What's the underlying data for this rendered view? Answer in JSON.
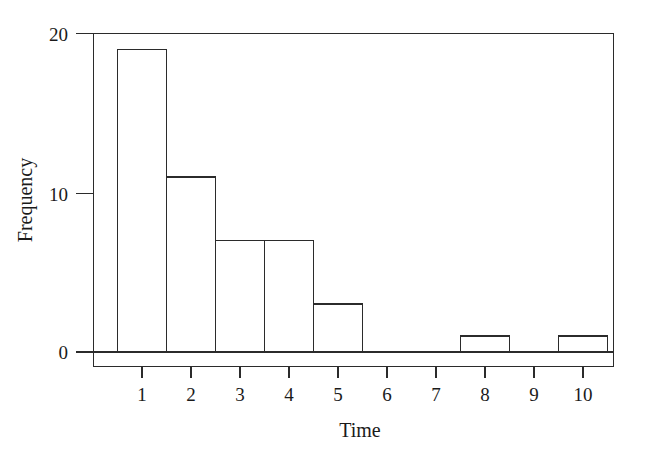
{
  "chart_data": {
    "type": "bar",
    "title": "",
    "subtitle": "",
    "xlabel": "Time",
    "ylabel": "Frequency",
    "categories": [
      "1",
      "2",
      "3",
      "4",
      "5",
      "6",
      "7",
      "8",
      "9",
      "10"
    ],
    "values": [
      19,
      11,
      7,
      7,
      3,
      0,
      0,
      1,
      0,
      1
    ],
    "series": [
      {
        "name": "Frequency",
        "values": [
          19,
          11,
          7,
          7,
          3,
          0,
          0,
          1,
          0,
          1
        ]
      }
    ],
    "x_tick_labels": [
      "1",
      "2",
      "3",
      "4",
      "5",
      "6",
      "7",
      "8",
      "9",
      "10"
    ],
    "y_tick_labels": [
      "0",
      "10",
      "20"
    ],
    "y_tick_values": [
      0,
      10,
      20
    ],
    "xlim": [
      0.5,
      10.5
    ],
    "ylim": [
      0,
      20
    ],
    "grid": false,
    "legend": false,
    "legend_position": "none",
    "bar_fill": "#ffffff",
    "bar_stroke": "#2b2b2b",
    "background": "#ffffff",
    "bin_width": 1,
    "annotations": []
  },
  "axes": {
    "y_title": "Frequency",
    "x_title": "Time"
  },
  "ticks": {
    "y": [
      {
        "label": "20",
        "value": 20
      },
      {
        "label": "10",
        "value": 10
      },
      {
        "label": "0",
        "value": 0
      }
    ],
    "x": [
      {
        "label": "1",
        "value": 1
      },
      {
        "label": "2",
        "value": 2
      },
      {
        "label": "3",
        "value": 3
      },
      {
        "label": "4",
        "value": 4
      },
      {
        "label": "5",
        "value": 5
      },
      {
        "label": "6",
        "value": 6
      },
      {
        "label": "7",
        "value": 7
      },
      {
        "label": "8",
        "value": 8
      },
      {
        "label": "9",
        "value": 9
      },
      {
        "label": "10",
        "value": 10
      }
    ]
  }
}
